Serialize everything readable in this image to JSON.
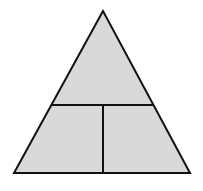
{
  "diagram": {
    "type": "divided-triangle",
    "width": 203,
    "height": 191,
    "colors": {
      "background": "#ffffff",
      "fill": "#d9d9d9",
      "stroke": "#111111"
    },
    "stroke_width": 2,
    "triangle": {
      "apex": [
        103,
        11
      ],
      "bottom_left": [
        14,
        173
      ],
      "bottom_right": [
        190,
        173
      ]
    },
    "horizontal_divider": {
      "x1": 52,
      "y1": 105,
      "x2": 154,
      "y2": 105
    },
    "vertical_divider": {
      "x1": 103,
      "y1": 105,
      "x2": 103,
      "y2": 173
    },
    "regions": [
      {
        "name": "top-triangle"
      },
      {
        "name": "bottom-left-trapezoid"
      },
      {
        "name": "bottom-right-trapezoid"
      }
    ]
  }
}
